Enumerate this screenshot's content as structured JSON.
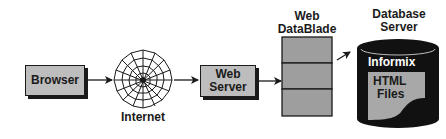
{
  "diagram": {
    "nodes": {
      "browser": {
        "label": "Browser"
      },
      "internet": {
        "label": "Internet",
        "icon": "web-globe-icon"
      },
      "web_server": {
        "label_line1": "Web",
        "label_line2": "Server"
      },
      "web_datablade": {
        "title_line1": "Web",
        "title_line2": "DataBlade",
        "segments": 3
      },
      "database_server": {
        "title_line1": "Database",
        "title_line2": "Server",
        "product": "Informix",
        "files_line1": "HTML",
        "files_line2": "Files"
      }
    },
    "edges": [
      {
        "from": "browser",
        "to": "internet"
      },
      {
        "from": "internet",
        "to": "web_server"
      },
      {
        "from": "web_server",
        "to": "web_datablade"
      },
      {
        "from": "web_datablade",
        "to": "database_server"
      }
    ],
    "colors": {
      "box_fill": "#bdbdbd",
      "stroke": "#1a1a1a",
      "cylinder": "#111111",
      "background": "#ffffff"
    }
  }
}
